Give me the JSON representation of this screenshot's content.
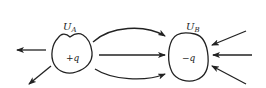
{
  "diagram": {
    "region_a": {
      "label": "U",
      "subscript": "A",
      "charge": "+q"
    },
    "region_b": {
      "label": "U",
      "subscript": "B",
      "charge": "−q"
    },
    "colors": {
      "line": "#222222",
      "background": "#ffffff"
    }
  }
}
